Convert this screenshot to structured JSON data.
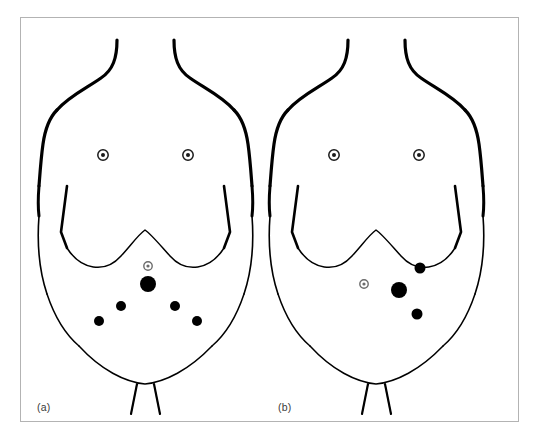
{
  "figure": {
    "frame_border_color": "#b3b3b3",
    "background_color": "#ffffff",
    "stroke_color": "#000000",
    "marker_color": "#000000",
    "umbilicus_color": "#6b6b6b",
    "nipple_color": "#1a1a1a"
  },
  "panels": [
    {
      "id": "a",
      "label": "(a)",
      "description": "Anterior torso outline with five port sites arranged in an inverted-V fan below the umbilicus",
      "landmarks": {
        "nipple_left": {
          "cx": 82,
          "cy": 137,
          "outer_r": 5.2,
          "inner_r": 2.0
        },
        "nipple_right": {
          "cx": 167,
          "cy": 137,
          "outer_r": 5.2,
          "inner_r": 2.0
        },
        "umbilicus": {
          "cx": 127,
          "cy": 248,
          "outer_r": 4.2,
          "inner_r": 1.6
        }
      },
      "port_sites": [
        {
          "name": "camera-port-umbilical",
          "cx": 127,
          "cy": 266,
          "r": 8.0,
          "size": "large"
        },
        {
          "name": "working-port-left-upper",
          "cx": 100,
          "cy": 288,
          "r": 5.0,
          "size": "small"
        },
        {
          "name": "working-port-right-upper",
          "cx": 154,
          "cy": 288,
          "r": 5.0,
          "size": "small"
        },
        {
          "name": "working-port-left-lower",
          "cx": 78,
          "cy": 303,
          "r": 5.0,
          "size": "small"
        },
        {
          "name": "working-port-right-lower",
          "cx": 176,
          "cy": 303,
          "r": 5.0,
          "size": "small"
        }
      ]
    },
    {
      "id": "b",
      "label": "(b)",
      "description": "Anterior torso outline with three port sites in an oblique right-sided arrangement lateral to the umbilicus",
      "landmarks": {
        "nipple_left": {
          "cx": 82,
          "cy": 137,
          "outer_r": 5.2,
          "inner_r": 2.0
        },
        "nipple_right": {
          "cx": 167,
          "cy": 137,
          "outer_r": 5.2,
          "inner_r": 2.0
        },
        "umbilicus": {
          "cx": 112,
          "cy": 266,
          "outer_r": 4.2,
          "inner_r": 1.6
        }
      },
      "port_sites": [
        {
          "name": "camera-port-paraumbilical",
          "cx": 147,
          "cy": 272,
          "r": 8.0,
          "size": "large"
        },
        {
          "name": "working-port-upper-right",
          "cx": 168,
          "cy": 250,
          "r": 5.5,
          "size": "small"
        },
        {
          "name": "working-port-lower-right",
          "cx": 165,
          "cy": 296,
          "r": 5.5,
          "size": "small"
        }
      ]
    }
  ],
  "torso_geometry": {
    "neck_left_path": "M 96 22 C 96 40, 92 52, 80 60 C 66 70, 48 78, 36 92",
    "neck_right_path": "M 153 22 C 153 40, 157 52, 169 60 C 183 70, 201 78, 213 92",
    "shoulder_left_path": "M 36 92 C 28 100, 24 112, 22 126 C 20 140, 19 155, 18 168",
    "shoulder_right_path": "M 213 92 C 221 100, 225 112, 227 126 C 229 140, 230 155, 231 168",
    "flank_left_path": "M 18 168 C 17 180, 17 190, 18 198",
    "flank_right_path": "M 231 168 C 232 180, 232 190, 231 198",
    "costal_left_path": "M 46 168 L 40 214 L 46 230",
    "costal_right_path": "M 203 168 L 209 214 L 203 230",
    "costal_arch_path": "M 46 230 C 60 252, 84 256, 100 238 C 110 227, 118 216, 124 212 C 130 216, 139 227, 149 238 C 165 256, 189 252, 203 230",
    "waist_left_path": "M 18 198 C 16 224, 18 252, 26 276",
    "waist_right_path": "M 231 198 C 233 224, 231 252, 223 276",
    "hip_left_path": "M 26 276 C 34 300, 44 316, 58 328",
    "hip_right_path": "M 223 276 C 215 300, 205 316, 191 328",
    "pelvic_curve_path": "M 58 328 C 80 352, 104 364, 124 366 C 144 364, 168 352, 191 328",
    "groin_left_path": "M 116 366 L 110 396",
    "groin_right_path": "M 133 366 L 139 396"
  }
}
